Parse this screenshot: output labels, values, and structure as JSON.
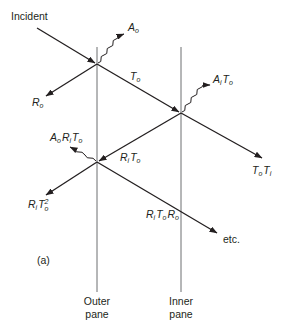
{
  "diagram": {
    "title_marker": "(a)",
    "panes": {
      "outer": {
        "line1": "Outer",
        "line2": "pane"
      },
      "inner": {
        "line1": "Inner",
        "line2": "pane"
      }
    },
    "rays": {
      "incident": "Incident",
      "reflected_outer": {
        "base": "R",
        "sub": "o"
      },
      "absorbed_outer": {
        "base": "A",
        "sub": "o"
      },
      "transmitted_outer": {
        "base": "T",
        "sub": "o"
      },
      "absorbed_inner": {
        "b1": "A",
        "s1": "i",
        "b2": "T",
        "s2": "o"
      },
      "transmitted_total": {
        "b1": "T",
        "s1": "o",
        "b2": "T",
        "s2": "i"
      },
      "reflected_inner": {
        "b1": "R",
        "s1": "i",
        "b2": "T",
        "s2": "o"
      },
      "absorbed_outer_2": {
        "b1": "A",
        "s1": "o",
        "b2": "R",
        "s2": "i",
        "b3": "T",
        "s3": "o"
      },
      "reflected_out": {
        "b1": "R",
        "s1": "i",
        "b2": "T",
        "s2": "o",
        "sup2": "2"
      },
      "second_pass": {
        "b1": "R",
        "s1": "i",
        "b2": "T",
        "s2": "o",
        "b3": "R",
        "s3": "o"
      },
      "continuation": "etc."
    },
    "colors": {
      "ray": "#231f20",
      "pane": "#6d6e71"
    }
  }
}
